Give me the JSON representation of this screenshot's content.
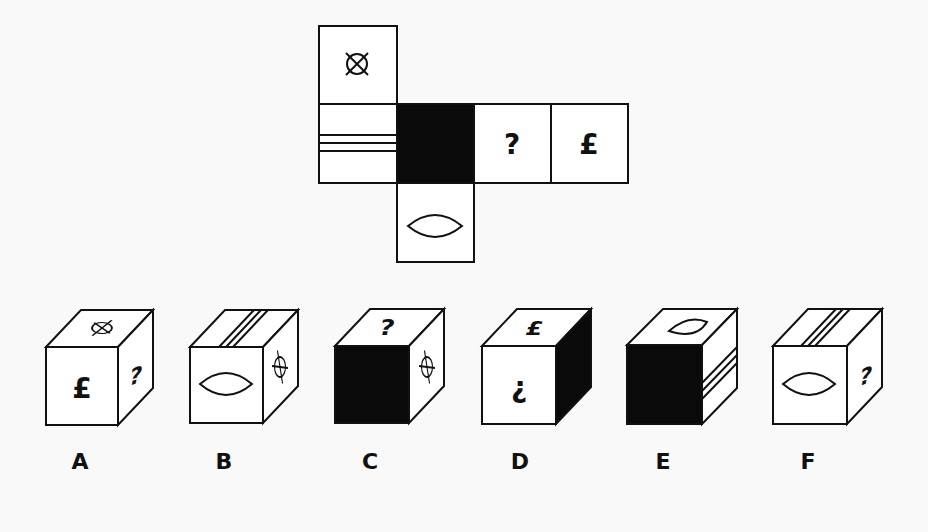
{
  "puzzle": {
    "type": "cube-net-folding",
    "net": {
      "faces": [
        {
          "position": "top",
          "symbol": "circled-x",
          "glyph": "⊗"
        },
        {
          "position": "left",
          "symbol": "three-horizontal-stripes",
          "glyph": ""
        },
        {
          "position": "center",
          "symbol": "solid-black",
          "glyph": ""
        },
        {
          "position": "right",
          "symbol": "question-mark",
          "glyph": "?"
        },
        {
          "position": "far-right",
          "symbol": "pound-sign",
          "glyph": "£"
        },
        {
          "position": "bottom",
          "symbol": "lens-ellipse",
          "glyph": ""
        }
      ]
    },
    "options": [
      {
        "label": "A",
        "front": "£",
        "top": "circled-x",
        "right": "?"
      },
      {
        "label": "B",
        "front": "lens-ellipse",
        "top": "three-stripes",
        "right": "circled-x"
      },
      {
        "label": "C",
        "front": "solid-black",
        "top": "?",
        "right": "circled-x"
      },
      {
        "label": "D",
        "front": "¿",
        "top": "£",
        "right": "solid-black"
      },
      {
        "label": "E",
        "front": "solid-black",
        "top": "lens-ellipse",
        "right": "three-stripes"
      },
      {
        "label": "F",
        "front": "lens-ellipse",
        "top": "three-stripes",
        "right": "?"
      }
    ]
  },
  "glyphs": {
    "question": "?",
    "pound": "£",
    "inverted_question": "¿"
  },
  "colors": {
    "background": "#f9f9f9",
    "stroke": "#111111",
    "fill_black": "#0a0a0a",
    "face_white": "#ffffff"
  }
}
